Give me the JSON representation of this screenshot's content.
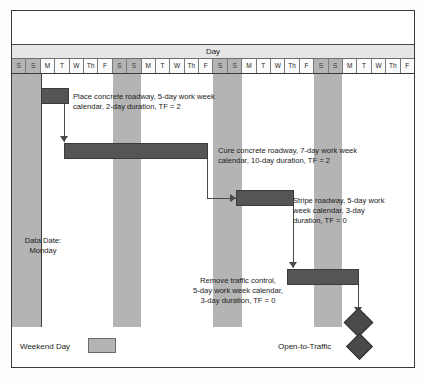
{
  "chart_data": {
    "type": "gantt",
    "title": "Day",
    "axis_label": "Day",
    "day_labels": [
      "S",
      "S",
      "M",
      "T",
      "W",
      "Th",
      "F",
      "S",
      "S",
      "M",
      "T",
      "W",
      "Th",
      "F",
      "S",
      "S",
      "M",
      "T",
      "W",
      "Th",
      "F",
      "S",
      "S",
      "M",
      "T",
      "W",
      "Th",
      "F"
    ],
    "weekend_indices": [
      0,
      1,
      7,
      8,
      14,
      15,
      21,
      22
    ],
    "total_days": 28,
    "data_date": "Monday",
    "tasks": [
      {
        "name": "Place concrete roadway",
        "label": "Place concrete roadway, 5-day work week\ncalendar, 2-day duration, TF = 2",
        "calendar": "5-day work week",
        "duration_days": 2,
        "total_float": 2,
        "start_day": 2,
        "end_day": 4
      },
      {
        "name": "Cure concrete roadway",
        "label": "Cure concrete roadway, 7-day work week\ncalendar, 10-day duration, TF = 2",
        "calendar": "7-day work week",
        "duration_days": 10,
        "total_float": 2,
        "start_day": 4,
        "end_day": 14
      },
      {
        "name": "Stripe roadway",
        "label": "Stripe roadway, 5-day work\nweek calendar, 3-day\nduration, TF = 0",
        "calendar": "5-day work week",
        "duration_days": 3,
        "total_float": 0,
        "start_day": 16,
        "end_day": 19
      },
      {
        "name": "Remove traffic control",
        "label": "Remove traffic control,\n5-day work week calendar,\n3-day duration, TF = 0",
        "calendar": "5-day work week",
        "duration_days": 3,
        "total_float": 0,
        "start_day": 19,
        "end_day": 24
      }
    ],
    "milestone": {
      "name": "Open-to-Traffic",
      "label": "Open-to-Traffic",
      "day": 24
    }
  },
  "header": {
    "day_axis_title": "Day"
  },
  "annotations": {
    "data_date": "Data Date:\nMonday",
    "task1": "Place concrete roadway, 5-day work week\ncalendar, 2-day duration, TF = 2",
    "task2": "Cure concrete roadway, 7-day work week\ncalendar, 10-day duration, TF = 2",
    "task3": "Stripe roadway, 5-day work\nweek calendar, 3-day\nduration, TF = 0",
    "task4": "Remove traffic control,\n5-day work week calendar,\n3-day duration, TF = 0"
  },
  "legend": {
    "weekend_label": "Weekend Day",
    "milestone_label": "Open-to-Traffic"
  },
  "colors": {
    "bar_fill": "#555555",
    "weekend_fill": "#b4b4b4",
    "header_fill": "#e6e6e6",
    "frame_border": "#3a3a3a",
    "connector": "#4a4a4a"
  }
}
